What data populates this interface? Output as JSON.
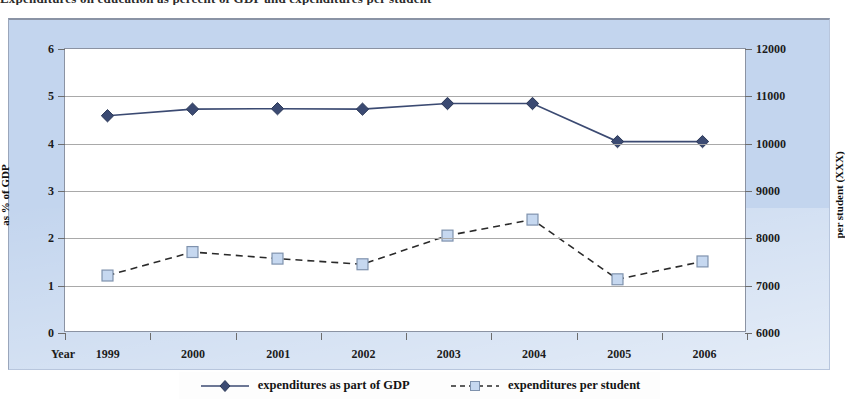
{
  "caption": "Expenditures on education as percent of GDP and expenditures per student",
  "chart_data": {
    "type": "line",
    "title": "",
    "xlabel": "Year",
    "categories": [
      "1999",
      "2000",
      "2001",
      "2002",
      "2003",
      "2004",
      "2005",
      "2006"
    ],
    "grid": true,
    "legend_position": "bottom",
    "axes": {
      "left": {
        "label": "as % of GDP",
        "ticks": [
          "0",
          "1",
          "2",
          "3",
          "4",
          "5",
          "6"
        ],
        "min": 0,
        "max": 6
      },
      "right": {
        "label": "per student (XXX)",
        "ticks": [
          "6000",
          "7000",
          "8000",
          "9000",
          "10000",
          "11000",
          "12000"
        ],
        "min": 6000,
        "max": 12000
      }
    },
    "series": [
      {
        "name": "expenditures as part of GDP",
        "axis": "left",
        "marker": "diamond",
        "line_style": "solid",
        "color": "#3b4a72",
        "values": [
          4.58,
          4.72,
          4.73,
          4.72,
          4.84,
          4.84,
          4.03,
          4.03
        ]
      },
      {
        "name": "expenditures per student",
        "axis": "right",
        "marker": "square",
        "line_style": "dashed",
        "color": "#2a2a2a",
        "marker_fill": "#c6d8f0",
        "values": [
          7180,
          7680,
          7540,
          7420,
          8030,
          8370,
          7100,
          7480
        ]
      }
    ]
  },
  "xaxis_word": "Year",
  "colors": {
    "panel": "#c3d5ee",
    "plot": "#ffffff",
    "grid": "#a9a9a9",
    "gdp_series": "#3b4a72",
    "student_series": "#2a2a2a"
  }
}
